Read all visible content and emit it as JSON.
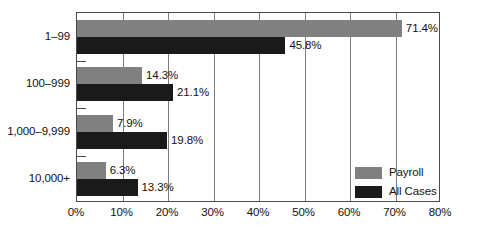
{
  "chart_data": {
    "type": "bar",
    "orientation": "horizontal",
    "title": "",
    "subtitle": "",
    "xlabel": "",
    "ylabel": "",
    "xlim": [
      0,
      80
    ],
    "grid": true,
    "legend_position": "bottom-right-inside",
    "categories": [
      "1–99",
      "100–999",
      "1,000–9,999",
      "10,000+"
    ],
    "xticks": [
      0,
      10,
      20,
      30,
      40,
      50,
      60,
      70,
      80
    ],
    "xtick_labels": [
      "0%",
      "10%",
      "20%",
      "30%",
      "40%",
      "50%",
      "60%",
      "70%",
      "80%"
    ],
    "series": [
      {
        "name": "Payroll",
        "color": "#808080",
        "values": [
          71.4,
          14.3,
          7.9,
          6.3
        ],
        "value_labels": [
          "71.4%",
          "14.3%",
          "7.9%",
          "6.3%"
        ]
      },
      {
        "name": "All Cases",
        "color": "#1a1a1a",
        "values": [
          45.8,
          21.1,
          19.8,
          13.3
        ],
        "value_labels": [
          "45.8%",
          "21.1%",
          "19.8%",
          "13.3%"
        ]
      }
    ]
  },
  "legend": {
    "items": [
      {
        "label": "Payroll",
        "color": "#808080"
      },
      {
        "label": "All Cases",
        "color": "#1a1a1a"
      }
    ]
  },
  "colors": {
    "payroll": "#808080",
    "all_cases": "#1a1a1a",
    "axis": "#4a4a4a",
    "gridline": "#7d7d7d",
    "background": "#ffffff",
    "text": "#111111"
  }
}
